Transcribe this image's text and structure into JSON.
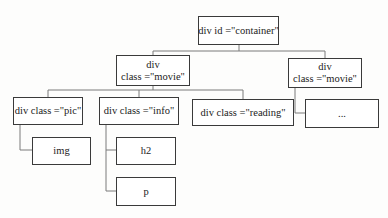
{
  "diagram": {
    "type": "dom-tree",
    "line_color": "#7a7a7a",
    "border_color": "#3a3a3a",
    "nodes": {
      "container": {
        "line1": "div id =\"container\"",
        "line2": ""
      },
      "movie1": {
        "line1": "div",
        "line2": "class =\"movie\""
      },
      "movie2": {
        "line1": "div",
        "line2": "class =\"movie\""
      },
      "pic": {
        "line1": "div class =\"pic\"",
        "line2": ""
      },
      "info": {
        "line1": "div class =\"info\"",
        "line2": ""
      },
      "reading": {
        "line1": "div class =\"reading\"",
        "line2": ""
      },
      "ellipsis": {
        "line1": "...",
        "line2": ""
      },
      "img": {
        "line1": "img",
        "line2": ""
      },
      "h2": {
        "line1": "h2",
        "line2": ""
      },
      "p": {
        "line1": "p",
        "line2": ""
      }
    },
    "edges": [
      [
        "container",
        "movie1"
      ],
      [
        "container",
        "movie2"
      ],
      [
        "movie1",
        "pic"
      ],
      [
        "movie1",
        "info"
      ],
      [
        "movie1",
        "reading"
      ],
      [
        "movie2",
        "ellipsis"
      ],
      [
        "pic",
        "img"
      ],
      [
        "info",
        "h2"
      ],
      [
        "info",
        "p"
      ]
    ]
  }
}
